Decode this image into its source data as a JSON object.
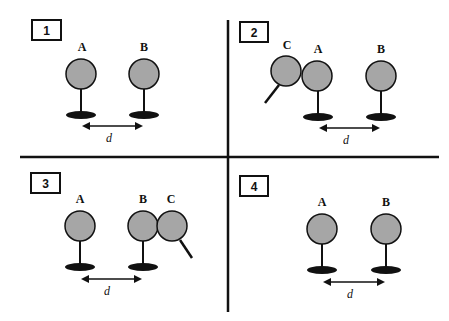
{
  "diagram": {
    "panels": [
      {
        "number": "1",
        "labels": {
          "A": "A",
          "B": "B"
        },
        "distance_label": "d"
      },
      {
        "number": "2",
        "labels": {
          "C": "C",
          "A": "A",
          "B": "B"
        },
        "distance_label": "d"
      },
      {
        "number": "3",
        "labels": {
          "A": "A",
          "B": "B",
          "C": "C"
        },
        "distance_label": "d"
      },
      {
        "number": "4",
        "labels": {
          "A": "A",
          "B": "B"
        },
        "distance_label": "d"
      }
    ],
    "colors": {
      "ball_fill": "#a6a6a6",
      "stroke": "#111111",
      "background": "#ffffff"
    }
  }
}
